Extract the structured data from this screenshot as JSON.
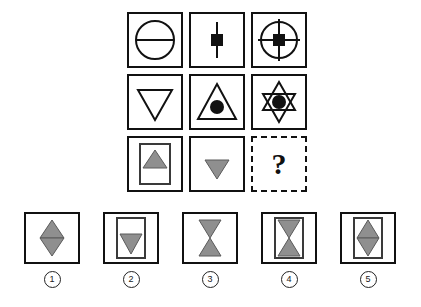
{
  "puzzle": {
    "type": "figural-matrix-reasoning",
    "title": "",
    "question_symbol": "?",
    "matrix": {
      "rows": 3,
      "columns": 3,
      "cells": [
        {
          "id": "r1c1",
          "name": "circle-with-horizontal-diameter",
          "description": "Outlined circle crossed by a horizontal line",
          "stroke": "#111111",
          "fill": "none"
        },
        {
          "id": "r1c2",
          "name": "vertical-line-with-black-square",
          "description": "Vertical line with a solid black square at its center",
          "stroke": "#111111",
          "fill": "#111111"
        },
        {
          "id": "r1c3",
          "name": "crosshair-circle-with-black-square",
          "description": "Circle with vertical and horizontal crosshair lines and a solid black square at center",
          "stroke": "#111111",
          "fill": "#111111"
        },
        {
          "id": "r2c1",
          "name": "outlined-down-triangle",
          "description": "Downward pointing outlined triangle",
          "stroke": "#111111",
          "fill": "none"
        },
        {
          "id": "r2c2",
          "name": "up-triangle-with-black-circle",
          "description": "Upward pointing outlined triangle containing a solid black circle",
          "stroke": "#111111",
          "fill": "#111111"
        },
        {
          "id": "r2c3",
          "name": "six-pointed-star-with-black-circle",
          "description": "Six pointed star (two overlapping triangles) containing a solid black circle",
          "stroke": "#111111",
          "fill": "#111111"
        },
        {
          "id": "r3c1",
          "name": "framed-gray-up-triangle",
          "description": "Inner portrait rectangle containing a gray upward triangle near the top",
          "stroke": "#3a3a3a",
          "fill": "#8f8f8f"
        },
        {
          "id": "r3c2",
          "name": "gray-down-triangle",
          "description": "Gray downward pointing triangle",
          "stroke": "#3a3a3a",
          "fill": "#8f8f8f"
        },
        {
          "id": "r3c3",
          "name": "missing-cell",
          "description": "Dashed outlined box containing a question mark",
          "stroke": "#111111",
          "fill": "none"
        }
      ]
    },
    "answer_options": [
      {
        "number": "1",
        "label": "1",
        "name": "option-gray-diamond",
        "description": "Gray vertical diamond (up triangle above down triangle) with no inner frame",
        "fill": "#8f8f8f",
        "stroke": "#3a3a3a"
      },
      {
        "number": "2",
        "label": "2",
        "name": "option-framed-gray-down-triangle",
        "description": "Inner portrait rectangle containing a gray downward triangle",
        "fill": "#8f8f8f",
        "stroke": "#3a3a3a"
      },
      {
        "number": "3",
        "label": "3",
        "name": "option-gray-hourglass",
        "description": "Gray hourglass (down triangle above up triangle) with no inner frame",
        "fill": "#8f8f8f",
        "stroke": "#3a3a3a"
      },
      {
        "number": "4",
        "label": "4",
        "name": "option-framed-gray-hourglass",
        "description": "Inner portrait rectangle containing a gray hourglass",
        "fill": "#8f8f8f",
        "stroke": "#3a3a3a"
      },
      {
        "number": "5",
        "label": "5",
        "name": "option-framed-gray-diamond",
        "description": "Inner portrait rectangle containing a gray vertical diamond",
        "fill": "#8f8f8f",
        "stroke": "#3a3a3a"
      }
    ],
    "colors": {
      "ink": "#111111",
      "gray_fill": "#8f8f8f",
      "gray_stroke": "#3a3a3a",
      "background": "#ffffff"
    }
  }
}
